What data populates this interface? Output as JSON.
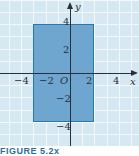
{
  "chart_data": {
    "type": "area",
    "title": "",
    "xlabel": "x",
    "ylabel": "y",
    "xlim": [
      -5.6,
      5.6
    ],
    "ylim": [
      -5.9,
      6.0
    ],
    "grid": true,
    "x_ticks": [
      -4,
      -2,
      0,
      2,
      4
    ],
    "y_ticks": [
      -4,
      -2,
      2,
      4
    ],
    "x_tick_labels": [
      "−4",
      "−2",
      "O",
      "2",
      "4"
    ],
    "y_tick_labels": [
      "4",
      "2",
      "−2",
      "−4"
    ],
    "shapes": [
      {
        "kind": "rectangle",
        "x_min": -3,
        "x_max": 2,
        "y_min": -4,
        "y_max": 4,
        "fill": "#6ea6cf",
        "edge": "#2878b0"
      }
    ],
    "colors": {
      "background": "#d6e9f2",
      "grid": "#f2f8fb",
      "axis": "#2a2f38"
    }
  },
  "labels": {
    "x_axis": "x",
    "y_axis": "y",
    "origin": "O",
    "xticks": [
      "−4",
      "−2",
      "2",
      "4"
    ],
    "yticks": [
      "4",
      "2",
      "−2",
      "−4"
    ]
  },
  "caption": "FIGURE 5.2x"
}
